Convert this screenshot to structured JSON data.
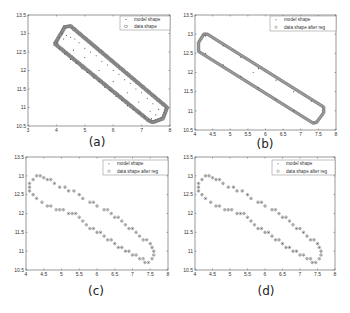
{
  "chart_data": [
    {
      "id": "a",
      "type": "scatter",
      "panel_label": "(a)",
      "frame": {
        "left": 28,
        "top": 15,
        "right": 170,
        "bottom": 126
      },
      "xlim": [
        3,
        8
      ],
      "ylim": [
        10.5,
        13.5
      ],
      "xticks": [
        3,
        4,
        5,
        6,
        7,
        8
      ],
      "xtick_labels": [
        "3",
        "4",
        "5",
        "6",
        "7",
        "8"
      ],
      "yticks": [
        10.5,
        11,
        11.5,
        12,
        12.5,
        13,
        13.5
      ],
      "ytick_labels": [
        "10.5",
        "11",
        "11.5",
        "12",
        "12.5",
        "13",
        "13.5"
      ],
      "grid": false,
      "legend": {
        "position": "upper right",
        "entries": [
          "model shape",
          "data shape"
        ],
        "box": {
          "x": 120,
          "y": 16,
          "w": 50,
          "h": 14
        }
      },
      "series": [
        {
          "name": "data shape",
          "marker": "square",
          "style": "dense-outline",
          "outline": [
            [
              3.95,
              12.72
            ],
            [
              4.3,
              13.18
            ],
            [
              4.5,
              13.2
            ],
            [
              7.9,
              11.0
            ],
            [
              7.75,
              10.7
            ],
            [
              7.4,
              10.6
            ],
            [
              7.25,
              10.65
            ],
            [
              3.95,
              12.72
            ]
          ]
        },
        {
          "name": "model shape",
          "marker": "dot",
          "points": [
            [
              4.1,
              12.9
            ],
            [
              4.2,
              13.0
            ],
            [
              4.35,
              12.95
            ],
            [
              4.5,
              12.9
            ],
            [
              4.65,
              12.85
            ],
            [
              4.8,
              12.75
            ],
            [
              5.0,
              12.6
            ],
            [
              5.2,
              12.5
            ],
            [
              5.4,
              12.4
            ],
            [
              5.6,
              12.25
            ],
            [
              5.8,
              12.15
            ],
            [
              6.0,
              12.0
            ],
            [
              6.2,
              11.9
            ],
            [
              6.4,
              11.75
            ],
            [
              6.6,
              11.65
            ],
            [
              6.8,
              11.5
            ],
            [
              7.0,
              11.4
            ],
            [
              7.2,
              11.25
            ],
            [
              7.4,
              11.1
            ],
            [
              7.6,
              10.95
            ],
            [
              7.5,
              10.8
            ],
            [
              7.35,
              10.7
            ],
            [
              4.1,
              12.6
            ],
            [
              4.3,
              12.45
            ],
            [
              4.5,
              12.3
            ],
            [
              4.7,
              12.2
            ],
            [
              4.9,
              12.05
            ],
            [
              5.1,
              11.95
            ],
            [
              5.3,
              11.8
            ],
            [
              5.5,
              11.7
            ],
            [
              5.7,
              11.55
            ],
            [
              5.9,
              11.45
            ],
            [
              6.1,
              11.3
            ],
            [
              6.3,
              11.2
            ],
            [
              6.5,
              11.05
            ],
            [
              6.7,
              10.95
            ],
            [
              6.9,
              10.85
            ],
            [
              7.1,
              10.75
            ],
            [
              4.05,
              12.75
            ],
            [
              4.25,
              12.85
            ],
            [
              5.0,
              12.35
            ],
            [
              6.0,
              11.7
            ],
            [
              6.9,
              11.15
            ],
            [
              4.6,
              12.55
            ],
            [
              5.5,
              12.0
            ],
            [
              6.5,
              11.4
            ],
            [
              7.3,
              10.9
            ]
          ]
        }
      ]
    },
    {
      "id": "b",
      "type": "scatter",
      "panel_label": "(b)",
      "frame": {
        "left": 195,
        "top": 15,
        "right": 336,
        "bottom": 130
      },
      "xlim": [
        4,
        8
      ],
      "ylim": [
        10.5,
        13.5
      ],
      "xticks": [
        4,
        4.5,
        5,
        5.5,
        6,
        6.5,
        7,
        7.5,
        8
      ],
      "xtick_labels": [
        "4",
        "4.5",
        "5",
        "5.5",
        "6",
        "6.5",
        "7",
        "7.5",
        "8"
      ],
      "yticks": [
        10.5,
        11,
        11.5,
        12,
        12.5,
        13,
        13.5
      ],
      "ytick_labels": [
        "10.5",
        "11",
        "11.5",
        "12",
        "12.5",
        "13",
        "13.5"
      ],
      "grid": false,
      "legend": {
        "position": "upper right",
        "entries": [
          "model shape",
          "data shape after reg"
        ],
        "box": {
          "x": 270,
          "y": 16,
          "w": 66,
          "h": 15
        }
      },
      "series": [
        {
          "name": "data shape after reg",
          "marker": "circle",
          "style": "dense-outline",
          "outline": [
            [
              4.1,
              12.78
            ],
            [
              4.25,
              13.0
            ],
            [
              4.35,
              13.0
            ],
            [
              7.65,
              11.1
            ],
            [
              7.65,
              10.95
            ],
            [
              7.45,
              10.7
            ],
            [
              7.35,
              10.68
            ],
            [
              4.1,
              12.55
            ],
            [
              4.1,
              12.78
            ]
          ]
        },
        {
          "name": "model shape",
          "marker": "dot",
          "points": [
            [
              4.3,
              12.95
            ],
            [
              4.8,
              12.7
            ],
            [
              5.3,
              12.4
            ],
            [
              5.8,
              12.1
            ],
            [
              6.3,
              11.8
            ],
            [
              6.8,
              11.5
            ],
            [
              7.3,
              11.25
            ],
            [
              4.3,
              12.5
            ],
            [
              4.8,
              12.2
            ],
            [
              5.3,
              11.9
            ],
            [
              5.8,
              11.6
            ],
            [
              6.3,
              11.3
            ],
            [
              6.8,
              11.0
            ],
            [
              5.65,
              12.0
            ]
          ]
        }
      ]
    },
    {
      "id": "c",
      "type": "scatter",
      "panel_label": "(c)",
      "frame": {
        "left": 26,
        "top": 157,
        "right": 168,
        "bottom": 270
      },
      "xlim": [
        4,
        8
      ],
      "ylim": [
        10.5,
        13.5
      ],
      "xticks": [
        4,
        4.5,
        5,
        5.5,
        6,
        6.5,
        7,
        7.5,
        8
      ],
      "xtick_labels": [
        "4",
        "4.5",
        "5",
        "5.5",
        "6",
        "6.5",
        "7",
        "7.5",
        "8"
      ],
      "yticks": [
        10.5,
        11,
        11.5,
        12,
        12.5,
        13,
        13.5
      ],
      "ytick_labels": [
        "10.5",
        "11",
        "11.5",
        "12",
        "12.5",
        "13",
        "13.5"
      ],
      "grid": false,
      "legend": {
        "position": "upper right",
        "entries": [
          "model shape",
          "data shape after reg"
        ],
        "box": {
          "x": 103,
          "y": 160,
          "w": 65,
          "h": 15
        }
      },
      "series": [
        {
          "name": "data shape after reg",
          "marker": "circle",
          "points": [
            [
              4.3,
              13.0
            ],
            [
              4.4,
              13.0
            ],
            [
              4.2,
              12.9
            ],
            [
              4.1,
              12.8
            ],
            [
              4.1,
              12.7
            ],
            [
              4.1,
              12.6
            ],
            [
              4.2,
              12.5
            ],
            [
              4.3,
              12.4
            ],
            [
              4.45,
              12.3
            ],
            [
              4.6,
              12.2
            ],
            [
              4.7,
              12.2
            ],
            [
              4.85,
              12.1
            ],
            [
              4.95,
              12.1
            ],
            [
              5.05,
              12.1
            ],
            [
              5.2,
              12.0
            ],
            [
              5.3,
              12.0
            ],
            [
              5.4,
              12.0
            ],
            [
              5.5,
              11.9
            ],
            [
              5.6,
              11.8
            ],
            [
              5.7,
              11.7
            ],
            [
              5.8,
              11.6
            ],
            [
              5.9,
              11.6
            ],
            [
              6.0,
              11.5
            ],
            [
              6.1,
              11.5
            ],
            [
              6.2,
              11.4
            ],
            [
              6.3,
              11.3
            ],
            [
              6.4,
              11.3
            ],
            [
              6.5,
              11.2
            ],
            [
              6.6,
              11.1
            ],
            [
              6.7,
              11.1
            ],
            [
              6.8,
              11.0
            ],
            [
              6.9,
              11.0
            ],
            [
              7.0,
              10.9
            ],
            [
              7.1,
              10.9
            ],
            [
              7.2,
              10.8
            ],
            [
              7.3,
              10.8
            ],
            [
              7.35,
              10.7
            ],
            [
              7.45,
              10.7
            ],
            [
              7.55,
              10.8
            ],
            [
              7.6,
              10.9
            ],
            [
              7.6,
              11.0
            ],
            [
              7.55,
              11.1
            ],
            [
              7.5,
              11.2
            ],
            [
              7.4,
              11.3
            ],
            [
              7.3,
              11.3
            ],
            [
              7.2,
              11.4
            ],
            [
              7.1,
              11.5
            ],
            [
              7.0,
              11.6
            ],
            [
              6.9,
              11.6
            ],
            [
              6.8,
              11.7
            ],
            [
              6.7,
              11.8
            ],
            [
              6.6,
              11.9
            ],
            [
              6.5,
              11.9
            ],
            [
              6.4,
              12.0
            ],
            [
              6.3,
              12.1
            ],
            [
              6.2,
              12.1
            ],
            [
              6.0,
              12.2
            ],
            [
              5.9,
              12.3
            ],
            [
              5.8,
              12.3
            ],
            [
              5.6,
              12.4
            ],
            [
              5.5,
              12.5
            ],
            [
              5.35,
              12.6
            ],
            [
              5.2,
              12.6
            ],
            [
              5.1,
              12.7
            ],
            [
              4.95,
              12.7
            ],
            [
              4.8,
              12.8
            ],
            [
              4.7,
              12.9
            ],
            [
              4.6,
              12.9
            ],
            [
              4.5,
              12.95
            ]
          ]
        },
        {
          "name": "model shape",
          "marker": "dot",
          "overlaps": "data shape after reg"
        }
      ]
    },
    {
      "id": "d",
      "type": "scatter",
      "panel_label": "(d)",
      "frame": {
        "left": 195,
        "top": 157,
        "right": 335,
        "bottom": 270
      },
      "xlim": [
        4,
        8
      ],
      "ylim": [
        10.5,
        13.5
      ],
      "xticks": [
        4,
        4.5,
        5,
        5.5,
        6,
        6.5,
        7,
        7.5,
        8
      ],
      "xtick_labels": [
        "4",
        "4.5",
        "5",
        "5.5",
        "6",
        "6.5",
        "7",
        "7.5",
        "8"
      ],
      "yticks": [
        10.5,
        11,
        11.5,
        12,
        12.5,
        13,
        13.5
      ],
      "ytick_labels": [
        "10.5",
        "11",
        "11.5",
        "12",
        "12.5",
        "13",
        "13.5"
      ],
      "grid": false,
      "legend": {
        "position": "upper right",
        "entries": [
          "model shape",
          "data shape after reg"
        ],
        "box": {
          "x": 272,
          "y": 160,
          "w": 63,
          "h": 15
        }
      },
      "series": [
        {
          "name": "data shape after reg",
          "marker": "circle",
          "same_as": "c"
        },
        {
          "name": "model shape",
          "marker": "dot",
          "overlaps": "data shape after reg"
        }
      ]
    }
  ],
  "labels": {
    "a": "(a)",
    "b": "(b)",
    "c": "(c)",
    "d": "(d)"
  },
  "colors": {
    "axis": "#555555",
    "marker": "#777777",
    "text": "#222222"
  }
}
